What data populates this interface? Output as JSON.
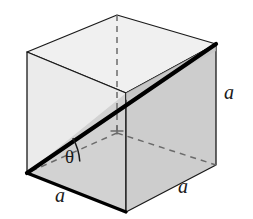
{
  "figure": {
    "background_color": "#ffffff",
    "shape": "cube",
    "projection": "oblique"
  },
  "colors": {
    "outline": "#1a1a1a",
    "bold_edge": "#000000",
    "hidden_edge": "#6b6b6b",
    "face_top": "#f0f0f0",
    "face_front_upper": "#ebebeb",
    "face_front_lower": "#d2d2d2",
    "face_right": "#cdcdcd",
    "face_right_dark": "#c4c4c4",
    "label_color": "#1a1a1a"
  },
  "geometry": {
    "vertices": {
      "front_top_left": [
        27,
        52
      ],
      "front_top_right": [
        126,
        93
      ],
      "front_bottom_right": [
        126,
        212
      ],
      "front_bottom_left": [
        27,
        173
      ],
      "back_top_left": [
        117,
        15
      ],
      "back_top_right": [
        216,
        44
      ],
      "back_bottom_right": [
        216,
        165
      ],
      "back_bottom_left": [
        117,
        133
      ]
    },
    "bold_diagonal": {
      "from": [
        27,
        173
      ],
      "to": [
        216,
        44
      ],
      "stroke_width": 4
    },
    "hidden_edges": [
      {
        "from": [
          117,
          15
        ],
        "to": [
          117,
          133
        ]
      },
      {
        "from": [
          117,
          133
        ],
        "to": [
          27,
          173
        ]
      },
      {
        "from": [
          117,
          133
        ],
        "to": [
          216,
          165
        ]
      }
    ],
    "angle_arc": {
      "vertex": [
        27,
        173
      ],
      "radius": 54,
      "start_deg": -34,
      "end_deg": -12
    },
    "right_angle_tick": {
      "at": [
        117,
        133
      ],
      "size": 7
    }
  },
  "labels": {
    "theta": {
      "text": "θ",
      "x": 68,
      "y": 157
    },
    "edge_bottom_left": {
      "text": "a",
      "x": 55,
      "y": 191
    },
    "edge_bottom_right": {
      "text": "a",
      "x": 178,
      "y": 181
    },
    "edge_vertical_right": {
      "text": "a",
      "x": 224,
      "y": 85
    }
  }
}
